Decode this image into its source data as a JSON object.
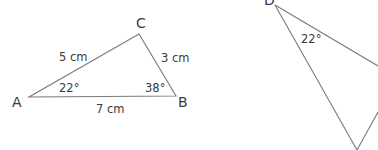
{
  "diagram": {
    "triangle_abc": {
      "vertices": {
        "A": {
          "label": "A"
        },
        "B": {
          "label": "B"
        },
        "C": {
          "label": "C"
        }
      },
      "sides": {
        "AC": "5 cm",
        "CB": "3 cm",
        "AB": "7 cm"
      },
      "angles": {
        "A": "22°",
        "B": "38°"
      }
    },
    "triangle_second": {
      "vertices": {
        "D": {
          "label": "D"
        }
      },
      "angles": {
        "D": "22°"
      }
    },
    "colors": {
      "line": "#7a7a7a",
      "text": "#3a3a3a",
      "background": "#ffffff"
    }
  }
}
